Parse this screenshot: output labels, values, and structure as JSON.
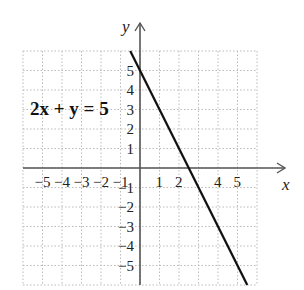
{
  "chart_data": {
    "type": "line",
    "title": "",
    "xlabel": "x",
    "ylabel": "y",
    "xlim": [
      -6,
      6
    ],
    "ylim": [
      -6,
      6
    ],
    "grid": true,
    "x_ticks": [
      "-5",
      "-4",
      "-3",
      "-2",
      "-1",
      "1",
      "2",
      "4",
      "5"
    ],
    "y_ticks": [
      "5",
      "4",
      "3",
      "2",
      "1",
      "-1",
      "-2",
      "-3",
      "-4",
      "-5"
    ],
    "series": [
      {
        "name": "2x + y = 5",
        "equation": "y = -2x + 5",
        "x": [
          -0.5,
          5.5
        ],
        "y": [
          6,
          -6
        ]
      }
    ],
    "annotations": [
      {
        "text": "2x + y = 5",
        "x": -5.5,
        "y": 3
      }
    ],
    "line_color": "#111111",
    "axis_color": "#555555",
    "grid_color": "#bbbbbb"
  },
  "labels": {
    "equation": "2x + y = 5",
    "x_axis": "x",
    "y_axis": "y"
  }
}
